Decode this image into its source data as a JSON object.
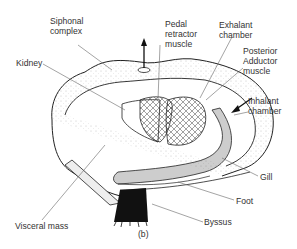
{
  "figure": {
    "panel_label": "(b)",
    "labels": {
      "siphonal": "Siphonal\ncomplex",
      "kidney": "Kidney",
      "pedal": "Pedal\nretractor\nmuscle",
      "exhalant": "Exhalant\nchamber",
      "posterior": "Posterior\nAdductor\nmuscle",
      "inhalant": "Inhalant\nchamber",
      "gill": "Gill",
      "foot": "Foot",
      "byssus": "Byssus",
      "visceral": "Visceral mass"
    }
  }
}
